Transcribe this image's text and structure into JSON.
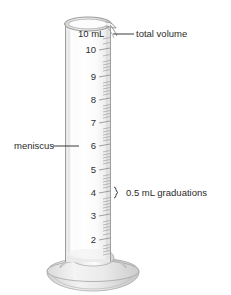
{
  "figure": {
    "title_alt": "Graduated cylinder diagram",
    "object_name": "graduated-cylinder",
    "capacity_label": "10 mL",
    "background_color": "#ffffff",
    "glass_color": "#f3f3f3",
    "outline_color": "#9a9a9a",
    "base_color": "#dcdcdc",
    "text_color": "#2b2b2b"
  },
  "annotations": {
    "total_volume": {
      "label": "total volume",
      "leader": "horizontal-line"
    },
    "meniscus": {
      "label": "meniscus",
      "leader": "horizontal-line"
    },
    "graduations": {
      "label": "0.5 mL graduations",
      "leader": "curly-brace",
      "interval_mL": 0.5
    }
  },
  "scale": {
    "unit": "mL",
    "max": 10,
    "minor_interval": 0.5,
    "labeled_marks": [
      {
        "value": "10",
        "y": 50
      },
      {
        "value": "9",
        "y": 77
      },
      {
        "value": "8",
        "y": 100
      },
      {
        "value": "7",
        "y": 123
      },
      {
        "value": "6",
        "y": 146
      },
      {
        "value": "5",
        "y": 170
      },
      {
        "value": "4",
        "y": 193
      },
      {
        "value": "3",
        "y": 216
      },
      {
        "value": "2",
        "y": 240
      }
    ]
  }
}
